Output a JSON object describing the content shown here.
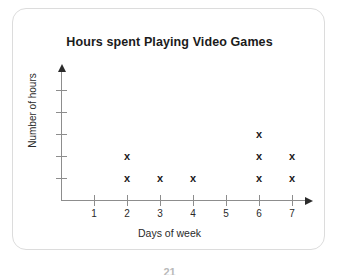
{
  "card": {
    "border_color": "#dcdcdc",
    "background": "#ffffff"
  },
  "chart_data": {
    "type": "scatter",
    "plot_style": "dot-plot",
    "marker": "x",
    "title": "Hours spent Playing Video Games",
    "xlabel": "Days of week",
    "ylabel": "Number of hours",
    "categories": [
      "1",
      "2",
      "3",
      "4",
      "5",
      "6",
      "7"
    ],
    "x": [
      1,
      2,
      3,
      4,
      5,
      6,
      7
    ],
    "values": [
      0,
      2,
      1,
      1,
      0,
      3,
      2
    ],
    "counts_by_day": {
      "1": 0,
      "2": 2,
      "3": 1,
      "4": 1,
      "5": 0,
      "6": 3,
      "7": 2
    },
    "xlim": [
      0,
      7.5
    ],
    "ylim": [
      0,
      5
    ],
    "y_tick_count": 5,
    "y_tick_labels": [
      "",
      "",
      "",
      "",
      ""
    ],
    "grid": false,
    "legend": null,
    "axis_arrows": true,
    "marker_color": "#1a1a1a",
    "axis_color": "#8d8d8d"
  },
  "footer": {
    "page_number": "21"
  }
}
